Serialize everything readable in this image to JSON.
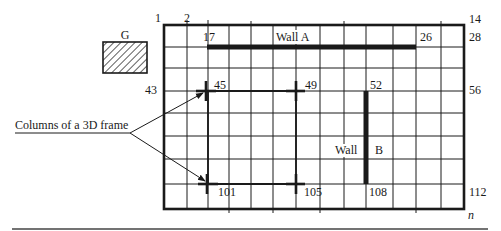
{
  "figure": {
    "grid": {
      "columns_x": [
        164,
        187,
        208,
        229,
        251,
        273,
        296,
        320,
        344,
        366,
        393,
        416,
        441,
        464
      ],
      "rows_y": [
        25,
        47,
        68,
        91,
        113,
        136,
        159,
        184,
        209
      ],
      "line_color": "#1a1a1a",
      "corner_labels": {
        "top_left_1": "1",
        "top_left_2": "2",
        "top_right": "14",
        "row2_right": "28",
        "row4_left": "43",
        "row4_right": "56",
        "bottom_right": "112",
        "corner_n": "n"
      }
    },
    "grid_nodes": {
      "n17": "17",
      "n26": "26",
      "n45": "45",
      "n49": "49",
      "n52": "52",
      "n101": "101",
      "n105": "105",
      "n108": "108"
    },
    "walls": {
      "wall_a": {
        "label": "Wall A"
      },
      "wall_b": {
        "label_left": "Wall",
        "label_right": "B"
      }
    },
    "ground_symbol": {
      "label": "G"
    },
    "annotation": {
      "text": "Columns of a 3D frame"
    }
  }
}
